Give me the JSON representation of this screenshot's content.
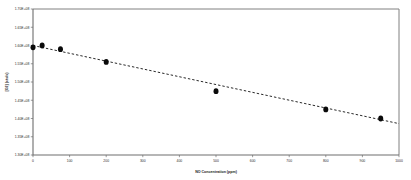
{
  "chart_data": {
    "type": "scatter",
    "title": "",
    "subtitle": "",
    "xlabel": "NO Concentration (ppm)",
    "ylabel": "[O2] (cts/s)",
    "xlim": [
      0,
      1000
    ],
    "ylim": [
      130000000,
      170000000
    ],
    "grid": false,
    "legend": null,
    "x_ticks": [
      0,
      100,
      200,
      300,
      400,
      500,
      600,
      700,
      800,
      900,
      1000
    ],
    "x_tick_labels": [
      "0",
      "100",
      "200",
      "300",
      "400",
      "500",
      "600",
      "700",
      "800",
      "900",
      "1000"
    ],
    "y_ticks": [
      130000000,
      135000000,
      140000000,
      145000000,
      150000000,
      155000000,
      160000000,
      165000000,
      170000000
    ],
    "y_tick_labels": [
      "1.30E+08",
      "1.35E+08",
      "1.40E+08",
      "1.45E+08",
      "1.50E+08",
      "1.55E+08",
      "1.60E+08",
      "1.65E+08",
      "1.70E+08"
    ],
    "series": [
      {
        "name": "measured",
        "marker": "circle",
        "color": "#0a0a0a",
        "x": [
          0,
          25,
          75,
          200,
          500,
          800,
          950
        ],
        "y": [
          159500000,
          160000000,
          159000000,
          155500000,
          147500000,
          142500000,
          140000000
        ]
      }
    ],
    "trendline": {
      "name": "linear-fit",
      "style": "dashed",
      "color": "#111111",
      "x": [
        0,
        1000
      ],
      "y": [
        160000000,
        138600000
      ]
    },
    "annotations": []
  }
}
